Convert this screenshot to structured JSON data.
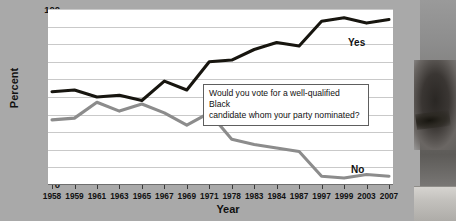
{
  "chart_data": {
    "type": "line",
    "title": "",
    "xlabel": "Year",
    "ylabel": "Percent",
    "ylim": [
      0,
      100
    ],
    "ytick_step": 10,
    "yticks": [
      0,
      10,
      20,
      30,
      40,
      50,
      60,
      70,
      80,
      90,
      100
    ],
    "grid": true,
    "legend_position": "inline-right-of-series",
    "categories": [
      "1958",
      "1959",
      "1961",
      "1963",
      "1965",
      "1967",
      "1969",
      "1971",
      "1978",
      "1983",
      "1984",
      "1987",
      "1997",
      "1999",
      "2003",
      "2007"
    ],
    "series": [
      {
        "name": "Yes",
        "color": "#17150f",
        "values": [
          53,
          54,
          50,
          51,
          48,
          59,
          54,
          70,
          71,
          77,
          81,
          79,
          93,
          95,
          92,
          94
        ]
      },
      {
        "name": "No",
        "color": "#8c8c8c",
        "values": [
          37,
          38,
          47,
          42,
          46,
          41,
          34,
          41,
          26,
          23,
          21,
          19,
          5,
          4,
          6,
          5
        ]
      }
    ],
    "annotations": [
      {
        "name": "survey-question",
        "line1": "Would you vote for a well-qualified Black",
        "line2": "candidate whom your party nominated?"
      }
    ]
  },
  "figure": {
    "background_color": "#a9a9a9",
    "plot_background_color": "#ffffff",
    "gridline_color": "#c9c9c9"
  },
  "photo": {
    "alt_name": "portrait-photo-fragment"
  }
}
